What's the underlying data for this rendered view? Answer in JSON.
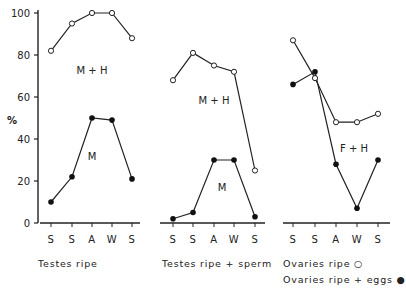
{
  "chart_data": [
    {
      "type": "line",
      "title": "Testes ripe",
      "ylabel": "%",
      "ylim": [
        0,
        100
      ],
      "yticks": [
        0,
        20,
        40,
        60,
        80,
        100
      ],
      "categories": [
        "S",
        "S",
        "A",
        "W",
        "S"
      ],
      "series": [
        {
          "name": "M + H",
          "marker": "open",
          "values": [
            82,
            95,
            100,
            100,
            88
          ]
        },
        {
          "name": "M",
          "marker": "filled",
          "values": [
            10,
            22,
            50,
            49,
            21
          ]
        }
      ],
      "annotations": [
        "M + H",
        "M"
      ]
    },
    {
      "type": "line",
      "title": "Testes ripe + sperm",
      "ylim": [
        0,
        100
      ],
      "categories": [
        "S",
        "S",
        "A",
        "W",
        "S"
      ],
      "series": [
        {
          "name": "M + H",
          "marker": "open",
          "values": [
            68,
            81,
            75,
            72,
            25
          ]
        },
        {
          "name": "M",
          "marker": "filled",
          "values": [
            2,
            5,
            30,
            30,
            3
          ]
        }
      ],
      "annotations": [
        "M + H",
        "M"
      ]
    },
    {
      "type": "line",
      "title": "Ovaries",
      "ylim": [
        0,
        100
      ],
      "categories": [
        "S",
        "S",
        "A",
        "W",
        "S"
      ],
      "series": [
        {
          "name": "Ovaries ripe",
          "marker": "open",
          "values": [
            87,
            69,
            48,
            48,
            52
          ]
        },
        {
          "name": "Ovaries ripe + eggs",
          "marker": "filled",
          "values": [
            66,
            72,
            28,
            7,
            30
          ]
        }
      ],
      "annotations": [
        "F + H"
      ]
    }
  ],
  "labels": {
    "y_axis": "%",
    "yticks": [
      "0",
      "20",
      "40",
      "60",
      "80",
      "100"
    ],
    "x_ticks": [
      "S",
      "S",
      "A",
      "W",
      "S"
    ],
    "panel1_mh": "M + H",
    "panel1_m": "M",
    "panel2_mh": "M + H",
    "panel2_m": "M",
    "panel3_fh": "F + H"
  },
  "captions": {
    "panel1": "Testes ripe",
    "panel2": "Testes ripe + sperm",
    "legend_open": "Ovaries ripe ○",
    "legend_filled": "Ovaries ripe + eggs ●"
  }
}
